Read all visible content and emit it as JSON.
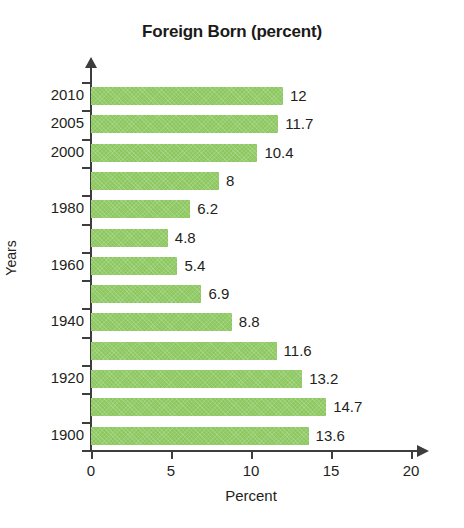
{
  "chart_data": {
    "type": "bar",
    "orientation": "horizontal",
    "title": "Foreign Born (percent)",
    "xlabel": "Percent",
    "ylabel": "Years",
    "xlim": [
      0,
      20
    ],
    "xticks": [
      0,
      5,
      10,
      15,
      20
    ],
    "xtick_labels": [
      "0",
      "5",
      "10",
      "15",
      "20"
    ],
    "grid": false,
    "legend": null,
    "bar_color": "#8cc75f",
    "axis_color": "#3d3d3d",
    "text_color": "#231f20",
    "categories": [
      "2010",
      "2005",
      "2000",
      "1990",
      "1980",
      "1970",
      "1960",
      "1950",
      "1940",
      "1930",
      "1920",
      "1910",
      "1900"
    ],
    "category_labels_shown": [
      "2010",
      "2005",
      "2000",
      "",
      "1980",
      "",
      "1960",
      "",
      "1940",
      "",
      "1920",
      "",
      "1900"
    ],
    "values": [
      12,
      11.7,
      10.4,
      8,
      6.2,
      4.8,
      5.4,
      6.9,
      8.8,
      11.6,
      13.2,
      14.7,
      13.6
    ],
    "value_labels": [
      "12",
      "11.7",
      "10.4",
      "8",
      "6.2",
      "4.8",
      "5.4",
      "6.9",
      "8.8",
      "11.6",
      "13.2",
      "14.7",
      "13.6"
    ],
    "bars": [
      {
        "category": "2010",
        "label": "2010",
        "value": 12,
        "value_label": "12"
      },
      {
        "category": "2005",
        "label": "2005",
        "value": 11.7,
        "value_label": "11.7"
      },
      {
        "category": "2000",
        "label": "2000",
        "value": 10.4,
        "value_label": "10.4"
      },
      {
        "category": "1990",
        "label": "",
        "value": 8,
        "value_label": "8"
      },
      {
        "category": "1980",
        "label": "1980",
        "value": 6.2,
        "value_label": "6.2"
      },
      {
        "category": "1970",
        "label": "",
        "value": 4.8,
        "value_label": "4.8"
      },
      {
        "category": "1960",
        "label": "1960",
        "value": 5.4,
        "value_label": "5.4"
      },
      {
        "category": "1950",
        "label": "",
        "value": 6.9,
        "value_label": "6.9"
      },
      {
        "category": "1940",
        "label": "1940",
        "value": 8.8,
        "value_label": "8.8"
      },
      {
        "category": "1930",
        "label": "",
        "value": 11.6,
        "value_label": "11.6"
      },
      {
        "category": "1920",
        "label": "1920",
        "value": 13.2,
        "value_label": "13.2"
      },
      {
        "category": "1910",
        "label": "",
        "value": 14.7,
        "value_label": "14.7"
      },
      {
        "category": "1900",
        "label": "1900",
        "value": 13.6,
        "value_label": "13.6"
      }
    ]
  }
}
